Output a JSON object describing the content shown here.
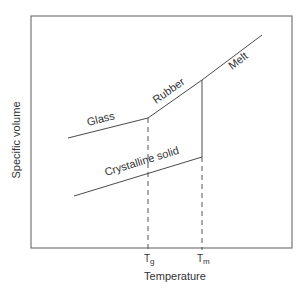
{
  "diagram": {
    "type": "specific-volume-vs-temperature",
    "xlabel": "Temperature",
    "ylabel": "Specific volume",
    "ticks": {
      "tg": {
        "main": "T",
        "sub": "g"
      },
      "tm": {
        "main": "T",
        "sub": "m"
      }
    },
    "regions": {
      "glass": "Glass",
      "rubber": "Rubber",
      "melt": "Melt",
      "crystalline": "Crystalline solid"
    },
    "colors": {
      "line": "#4a4a4a",
      "frame": "#777777",
      "text": "#333333"
    }
  }
}
